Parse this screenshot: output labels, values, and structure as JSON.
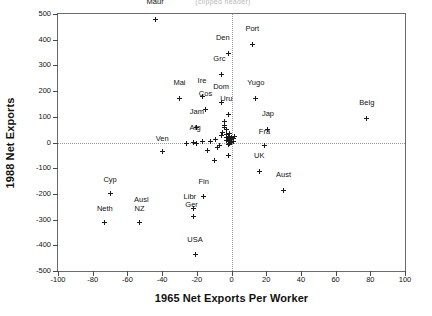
{
  "figure": {
    "title_strip": "(clipped header)",
    "x_axis_title": "1965 Net Exports Per Worker",
    "y_axis_title": "1988 Net Exports"
  },
  "chart_data": {
    "type": "scatter",
    "title": "",
    "xlabel": "1965 Net Exports Per Worker",
    "ylabel": "1988 Net Exports",
    "xlim": [
      -100,
      100
    ],
    "ylim": [
      -500,
      500
    ],
    "xticks": [
      -100,
      -80,
      -60,
      -40,
      -20,
      0,
      20,
      40,
      60,
      80,
      100
    ],
    "yticks": [
      -500,
      -400,
      -300,
      -200,
      -100,
      0,
      100,
      200,
      300,
      400,
      500
    ],
    "xticklabels": [
      "-100",
      "-80",
      "-60",
      "-40",
      "-20",
      "0",
      "20",
      "40",
      "60",
      "80",
      "100"
    ],
    "yticklabels": [
      "-500",
      "-400",
      "-300",
      "-200",
      "-100",
      "0",
      "100",
      "200",
      "300",
      "400",
      "500"
    ],
    "grid": false,
    "reference_lines": [
      {
        "axis": "y",
        "value": 0,
        "style": "dotted"
      },
      {
        "axis": "x",
        "value": 0,
        "style": "dotted"
      }
    ],
    "legend": null,
    "marker": "plus",
    "marker_color": "#1a1a1a",
    "points": [
      {
        "label": "Maur",
        "x": -44,
        "y": 480,
        "lx": -44,
        "ly": 545
      },
      {
        "label": "Port",
        "x": 12,
        "y": 380,
        "lx": 12,
        "ly": 440
      },
      {
        "label": "Den",
        "x": -2,
        "y": 348,
        "lx": -5,
        "ly": 408
      },
      {
        "label": "Grc",
        "x": -6,
        "y": 265,
        "lx": -7,
        "ly": 325
      },
      {
        "label": "Mai",
        "x": -30,
        "y": 173,
        "lx": -30,
        "ly": 233
      },
      {
        "label": "Ire",
        "x": -17,
        "y": 180,
        "lx": -17,
        "ly": 240
      },
      {
        "label": "Cos",
        "x": -15,
        "y": 130,
        "lx": -15,
        "ly": 190
      },
      {
        "label": "Dom",
        "x": -6,
        "y": 155,
        "lx": -6,
        "ly": 215
      },
      {
        "label": "Yugo",
        "x": 14,
        "y": 170,
        "lx": 14,
        "ly": 230
      },
      {
        "label": "Uru",
        "x": -2,
        "y": 108,
        "lx": -3,
        "ly": 168
      },
      {
        "label": "Belg",
        "x": 78,
        "y": 92,
        "lx": 78,
        "ly": 152
      },
      {
        "label": "Jam",
        "x": -20,
        "y": 58,
        "lx": -20,
        "ly": 118
      },
      {
        "label": "Jap",
        "x": 21,
        "y": 52,
        "lx": 21,
        "ly": 112
      },
      {
        "label": "Afg",
        "x": -22,
        "y": 1,
        "lx": -21,
        "ly": 58
      },
      {
        "label": "Fra",
        "x": 19,
        "y": -12,
        "lx": 19,
        "ly": 42
      },
      {
        "label": "Ven",
        "x": -40,
        "y": -35,
        "lx": -40,
        "ly": 13
      },
      {
        "label": "UK",
        "x": 16,
        "y": -113,
        "lx": 16,
        "ly": -53
      },
      {
        "label": "Aust",
        "x": 30,
        "y": -185,
        "lx": 30,
        "ly": -125
      },
      {
        "label": "Cyp",
        "x": -70,
        "y": -200,
        "lx": -70,
        "ly": -145
      },
      {
        "label": "Fin",
        "x": -16,
        "y": -212,
        "lx": -16,
        "ly": -155
      },
      {
        "label": "Libr",
        "x": -22,
        "y": -257,
        "lx": -24,
        "ly": -212
      },
      {
        "label": "Ger",
        "x": -22,
        "y": -287,
        "lx": -23,
        "ly": -245
      },
      {
        "label": "Ausl",
        "x": -53,
        "y": -310,
        "lx": -52,
        "ly": -222
      },
      {
        "label": "NZ",
        "x": -53,
        "y": -310,
        "lx": -53,
        "ly": -258
      },
      {
        "label": "Neth",
        "x": -73,
        "y": -310,
        "lx": -73,
        "ly": -258
      },
      {
        "label": "USA",
        "x": -21,
        "y": -435,
        "lx": -21,
        "ly": -378
      }
    ],
    "unlabeled_points": [
      {
        "x": -14,
        "y": -30
      },
      {
        "x": -12,
        "y": 2
      },
      {
        "x": -9,
        "y": 10
      },
      {
        "x": -8,
        "y": -20
      },
      {
        "x": -7,
        "y": -13
      },
      {
        "x": -6,
        "y": 28
      },
      {
        "x": -5,
        "y": 40
      },
      {
        "x": -4,
        "y": 58
      },
      {
        "x": -4,
        "y": 80
      },
      {
        "x": -4,
        "y": 68
      },
      {
        "x": -3,
        "y": 50
      },
      {
        "x": -3,
        "y": 30
      },
      {
        "x": -3,
        "y": 18
      },
      {
        "x": -3,
        "y": 8
      },
      {
        "x": -2,
        "y": 22
      },
      {
        "x": -2,
        "y": 12
      },
      {
        "x": -2,
        "y": 2
      },
      {
        "x": -2,
        "y": -8
      },
      {
        "x": -1,
        "y": 35
      },
      {
        "x": -1,
        "y": 16
      },
      {
        "x": -1,
        "y": 6
      },
      {
        "x": -1,
        "y": -4
      },
      {
        "x": 0,
        "y": 20
      },
      {
        "x": 0,
        "y": 10
      },
      {
        "x": 0,
        "y": 0
      },
      {
        "x": 1,
        "y": 14
      },
      {
        "x": 1,
        "y": 4
      },
      {
        "x": 2,
        "y": 24
      },
      {
        "x": -10,
        "y": -70
      },
      {
        "x": -2,
        "y": -50
      },
      {
        "x": -17,
        "y": 2
      },
      {
        "x": -20,
        "y": -2
      },
      {
        "x": -26,
        "y": -4
      }
    ]
  }
}
